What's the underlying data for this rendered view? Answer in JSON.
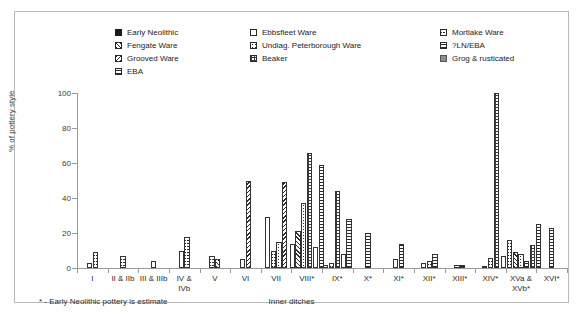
{
  "chart_data": {
    "type": "bar",
    "title": "",
    "xlabel": "Inner ditches",
    "ylabel": "% of pottery style",
    "ylim": [
      0,
      100
    ],
    "yticks": [
      0,
      20,
      40,
      60,
      80,
      100
    ],
    "grid": false,
    "legend_position": "top",
    "footnote": "* - Early Neolithic pottery is estimate",
    "categories": [
      "I",
      "II & IIb",
      "III & IIIb",
      "IV &\nIVb",
      "V",
      "VI",
      "VII",
      "VIII*",
      "IX*",
      "X*",
      "XI*",
      "XII*",
      "XIII*",
      "XIV*",
      "XVa &\nXVb*",
      "XVI*"
    ],
    "series": [
      {
        "name": "Early Neolithic",
        "pattern": "p-solid",
        "values": [
          3,
          0,
          4,
          0,
          0,
          0,
          29,
          0,
          2,
          0,
          5,
          3,
          2,
          1,
          7,
          0
        ]
      },
      {
        "name": "Ebbsfleet Ware",
        "pattern": "p-empty",
        "values": [
          0,
          0,
          0,
          10,
          0,
          5,
          0,
          14,
          0,
          0,
          0,
          0,
          0,
          0,
          0,
          0
        ]
      },
      {
        "name": "Mortlake Ware",
        "pattern": "p-crosshatch",
        "values": [
          9,
          7,
          0,
          18,
          7,
          0,
          10,
          0,
          3,
          0,
          0,
          4,
          0,
          6,
          16,
          0
        ]
      },
      {
        "name": "Fengate Ware",
        "pattern": "p-diag",
        "values": [
          0,
          0,
          0,
          0,
          5,
          0,
          0,
          21,
          0,
          0,
          0,
          0,
          0,
          0,
          9,
          0
        ]
      },
      {
        "name": "Undiag. Peterborough Ware",
        "pattern": "p-dots",
        "values": [
          0,
          0,
          0,
          0,
          0,
          0,
          15,
          37,
          0,
          0,
          0,
          0,
          0,
          0,
          8,
          0
        ]
      },
      {
        "name": "?LN/EBA",
        "pattern": "p-hlines",
        "values": [
          0,
          0,
          0,
          0,
          0,
          0,
          0,
          0,
          0,
          0,
          0,
          0,
          0,
          0,
          4,
          0
        ]
      },
      {
        "name": "Grooved Ware",
        "pattern": "p-backdiag",
        "values": [
          0,
          0,
          0,
          0,
          0,
          50,
          49,
          0,
          0,
          0,
          0,
          0,
          0,
          0,
          0,
          0
        ]
      },
      {
        "name": "Beaker",
        "pattern": "p-grid",
        "values": [
          0,
          0,
          0,
          0,
          0,
          0,
          0,
          66,
          44,
          0,
          0,
          0,
          0,
          100,
          13,
          0
        ]
      },
      {
        "name": "Grog & rusticated",
        "pattern": "p-grey",
        "values": [
          0,
          0,
          0,
          0,
          0,
          0,
          0,
          12,
          8,
          0,
          0,
          0,
          0,
          0,
          0,
          0
        ]
      },
      {
        "name": "EBA",
        "pattern": "p-hlines",
        "values": [
          0,
          0,
          0,
          0,
          0,
          0,
          0,
          59,
          28,
          20,
          14,
          8,
          2,
          0,
          25,
          23
        ]
      }
    ]
  },
  "legend": {
    "items": [
      {
        "label": "Early Neolithic",
        "pattern": "p-solid"
      },
      {
        "label": "Ebbsfleet Ware",
        "pattern": "p-empty"
      },
      {
        "label": "Mortlake Ware",
        "pattern": "p-crosshatch"
      },
      {
        "label": "Fengate Ware",
        "pattern": "p-diag"
      },
      {
        "label": "Undiag. Peterborough Ware",
        "pattern": "p-dots"
      },
      {
        "label": "?LN/EBA",
        "pattern": "p-hlines"
      },
      {
        "label": "Grooved Ware",
        "pattern": "p-backdiag"
      },
      {
        "label": "Beaker",
        "pattern": "p-grid"
      },
      {
        "label": "Grog & rusticated",
        "pattern": "p-grey"
      },
      {
        "label": "EBA",
        "pattern": "p-hlines"
      }
    ]
  }
}
